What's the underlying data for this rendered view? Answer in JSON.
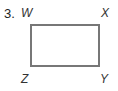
{
  "problem": {
    "number": "3.",
    "figure": {
      "shape": "rectangle",
      "border_color": "#777777",
      "vertices": {
        "top_left": "W",
        "top_right": "X",
        "bottom_right": "Y",
        "bottom_left": "Z"
      }
    }
  }
}
